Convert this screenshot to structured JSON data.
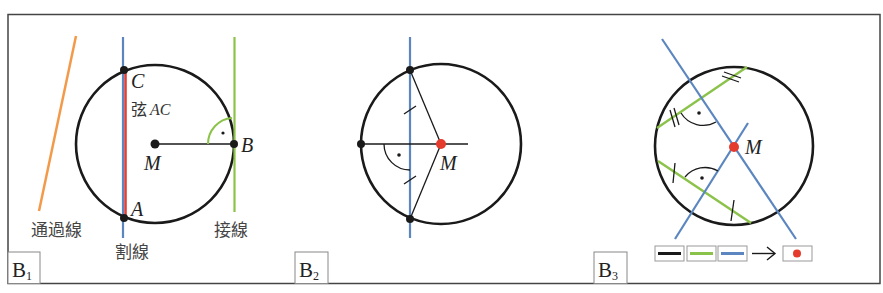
{
  "colors": {
    "circle": "#1a1a1a",
    "secant": "#5b86c0",
    "chord": "#e0403a",
    "tangent": "#8bc34a",
    "passing": "#f39a4a",
    "center_point": "#e53b2c",
    "frame": "#444444"
  },
  "panels": [
    {
      "id": "B1",
      "label_main": "B",
      "label_sub": "1",
      "labels": {
        "passing_line": "通過線",
        "secant": "割線",
        "tangent": "接線",
        "chord_prefix": "弦",
        "chord_name": "AC",
        "point_c": "C",
        "point_a": "A",
        "point_b": "B",
        "center": "M"
      }
    },
    {
      "id": "B2",
      "label_main": "B",
      "label_sub": "2",
      "labels": {
        "center": "M"
      }
    },
    {
      "id": "B3",
      "label_main": "B",
      "label_sub": "3",
      "labels": {
        "center": "M"
      },
      "legend": {
        "items": [
          "black-segment",
          "green-segment",
          "blue-segment"
        ],
        "arrow": "→",
        "result": "red-point"
      }
    }
  ]
}
